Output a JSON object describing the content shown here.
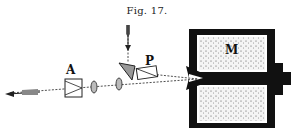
{
  "figure": {
    "caption": "Fig. 17.",
    "labels": {
      "analyzer": "A",
      "polarizer": "P",
      "magnet": "M"
    },
    "components": [
      {
        "id": "incident-light-arrow",
        "description": "light entering from top"
      },
      {
        "id": "reflecting-prism",
        "description": "triangular prism"
      },
      {
        "id": "polarizer",
        "label": "P"
      },
      {
        "id": "lens-1",
        "description": "lens"
      },
      {
        "id": "lens-2",
        "description": "lens"
      },
      {
        "id": "analyzer",
        "label": "A"
      },
      {
        "id": "electromagnet",
        "label": "M",
        "description": "magnet with coils and pole pieces"
      },
      {
        "id": "exit-light-arrow",
        "description": "emerging light to the left"
      }
    ],
    "colors": {
      "ink": "#111111",
      "background": "#ffffff",
      "coil-fill": "#f2f2f2"
    }
  }
}
